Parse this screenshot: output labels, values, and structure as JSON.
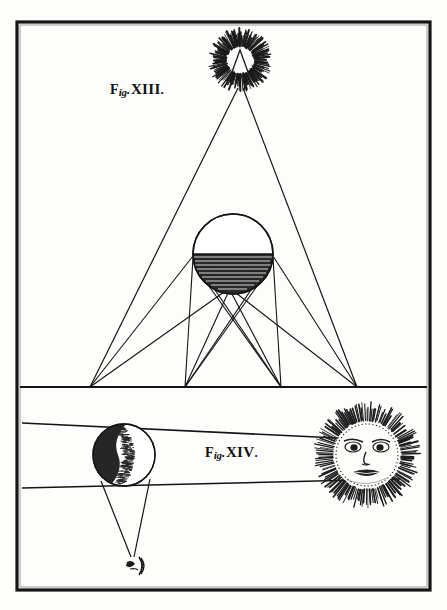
{
  "plate": {
    "name": "astronomical-plate",
    "background_color": "#fdfdfb",
    "ink_color": "#111111",
    "width": 447,
    "height": 610,
    "border": {
      "name": "plate-border",
      "x": 17,
      "y": 22,
      "width": 413,
      "height": 568,
      "stroke_width": 3
    },
    "divider_line": {
      "name": "horizon-divider",
      "y": 387
    }
  },
  "figures": [
    {
      "id": "fig-xiii",
      "label": {
        "word": "F",
        "sub": "ig",
        "dot_after_sub": ".",
        "numeral": "XIII",
        "trailing_dot": ".",
        "full_text": "Fig. XIII."
      },
      "label_position": {
        "x": 110,
        "y": 80
      },
      "elements": {
        "sun_burst": {
          "name": "sun-burst-top",
          "cx": 240,
          "cy": 60,
          "inner_radius": 13,
          "outer_radius": 32,
          "ray_count": 150,
          "center_light": true
        },
        "sphere": {
          "name": "shaded-sphere",
          "cx": 233,
          "cy": 254,
          "radius": 40,
          "upper_half": "light",
          "lower_half": "hatched-dark",
          "hatch_lines": 17
        },
        "ground_line_y": 387,
        "convergence_points_x": [
          90,
          185,
          281,
          357
        ]
      }
    },
    {
      "id": "fig-xiv",
      "label": {
        "word": "F",
        "sub": "ig",
        "dot_after_sub": ".",
        "numeral": "XIV",
        "trailing_dot": ".",
        "full_text": "Fig. XIV."
      },
      "label_position": {
        "x": 205,
        "y": 443
      },
      "elements": {
        "sun_face": {
          "name": "sun-with-face",
          "cx": 367,
          "cy": 455,
          "disc_radius": 33,
          "outer_radius": 54,
          "ray_count": 160,
          "face": {
            "left_eye": {
              "cx": 354,
              "cy": 446
            },
            "right_eye": {
              "cx": 379,
              "cy": 446
            },
            "nose": {
              "cx": 367,
              "cy": 458
            },
            "mouth": {
              "cx": 367,
              "cy": 472
            }
          }
        },
        "moon_sphere": {
          "name": "half-shaded-moon",
          "cx": 124,
          "cy": 455,
          "radius": 31,
          "shaded_side": "left"
        },
        "tangent_band": {
          "name": "tangent-ray-band",
          "upper_left": {
            "x": 22,
            "y": 424
          },
          "upper_right": {
            "x": 400,
            "y": 440
          },
          "lower_left": {
            "x": 22,
            "y": 487
          },
          "lower_right": {
            "x": 400,
            "y": 478
          }
        },
        "shadow_cone": {
          "name": "shadow-cone",
          "apex": {
            "x": 131,
            "y": 557
          }
        },
        "crescent": {
          "name": "small-crescent",
          "cx": 136,
          "cy": 566,
          "radius": 9
        }
      }
    }
  ]
}
